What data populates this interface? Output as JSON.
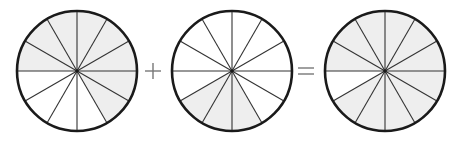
{
  "diagram": {
    "type": "fraction-addition",
    "segments_per_circle": 12,
    "colors": {
      "background": "#ffffff",
      "outline": "#1a1a1a",
      "divider": "#333333",
      "shade": "#eeeeee",
      "operator": "#777777"
    },
    "circles": [
      {
        "id": "circle-1",
        "cx": 77,
        "cy": 71,
        "r": 60,
        "shaded_segments": [
          0,
          1,
          2,
          3,
          4,
          5,
          10,
          11
        ],
        "shaded_count": 8
      },
      {
        "id": "circle-2",
        "cx": 232,
        "cy": 71,
        "r": 60,
        "shaded_segments": [
          7,
          8,
          9
        ],
        "shaded_count": 3
      },
      {
        "id": "circle-3",
        "cx": 385,
        "cy": 71,
        "r": 60,
        "shaded_segments": [
          0,
          1,
          2,
          3,
          4,
          5,
          7,
          8,
          9,
          10,
          11
        ],
        "shaded_count": 11
      }
    ],
    "operators": [
      {
        "id": "plus-sign",
        "symbol": "+",
        "x": 153,
        "y": 71
      },
      {
        "id": "equals-sign",
        "symbol": "=",
        "x": 306,
        "y": 71
      }
    ]
  }
}
